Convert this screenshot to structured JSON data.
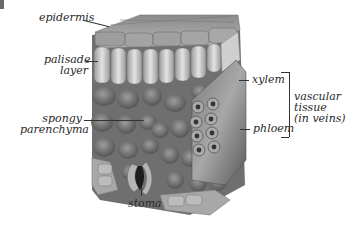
{
  "figure": {
    "type": "leaf cross-section diagram",
    "colors": {
      "background": "#ffffff",
      "text": "#2a2a2a",
      "cells_dark": "#5a5a5a",
      "cells_light": "#bdbdbd"
    }
  },
  "labels": {
    "epidermis": "epidermis",
    "palisade_line1": "palisade",
    "palisade_line2": "layer",
    "spongy_line1": "spongy",
    "spongy_line2": "parenchyma",
    "stoma": "stoma",
    "xylem": "xylem",
    "phloem": "phloem",
    "vascular_line1": "vascular",
    "vascular_line2": "tissue",
    "vascular_line3": "(in veins)"
  }
}
